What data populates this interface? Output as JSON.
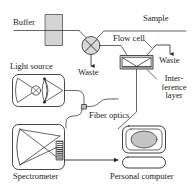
{
  "diagram": {
    "type": "instrument-schematic",
    "colors": {
      "stroke": "#262626",
      "fill_light_gray": "#d4d4d4",
      "fill_mid_gray": "#b8b8b8",
      "fill_dark_gray": "#8a8a8a",
      "background": "#ffffff",
      "text": "#1a1a1a"
    },
    "labels": {
      "buffer": "Buffer",
      "sample": "Sample",
      "flow_cell": "Flow cell",
      "waste_valve": "Waste",
      "waste_cell": "Waste",
      "interference_layer_line1": "Inter-",
      "interference_layer_line2": "ference",
      "interference_layer_line3": "layer",
      "light_source": "Light source",
      "fiber_optics": "Fiber optics",
      "spectrometer": "Spectrometer",
      "personal_computer": "Personal computer"
    },
    "components": [
      {
        "name": "buffer-reservoir",
        "label": "Buffer",
        "shape": "filled-rectangle"
      },
      {
        "name": "sample-line",
        "label": "Sample",
        "shape": "line"
      },
      {
        "name": "injection-valve",
        "label": "",
        "shape": "circle-with-cross"
      },
      {
        "name": "flow-cell",
        "label": "Flow cell",
        "shape": "layered-rectangle"
      },
      {
        "name": "interference-layer",
        "label": "Interference layer",
        "shape": "wedge"
      },
      {
        "name": "waste-outlet-valve",
        "label": "Waste",
        "shape": "arrow-down"
      },
      {
        "name": "waste-outlet-cell",
        "label": "Waste",
        "shape": "arrow-down"
      },
      {
        "name": "light-source",
        "label": "Light source",
        "shape": "rounded-box-with-lenses"
      },
      {
        "name": "fiber-optics-coupler",
        "label": "Fiber optics",
        "shape": "small-square-on-curve"
      },
      {
        "name": "spectrometer",
        "label": "Spectrometer",
        "shape": "rounded-box-with-mirror-and-detector"
      },
      {
        "name": "personal-computer",
        "label": "Personal computer",
        "shape": "monitor-and-base"
      }
    ]
  }
}
